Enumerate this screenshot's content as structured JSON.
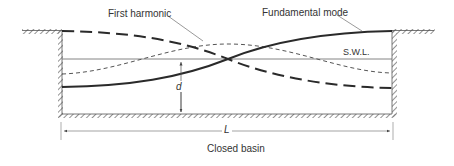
{
  "diagram": {
    "caption": "Closed basin",
    "labels": {
      "first_harmonic": "First harmonic",
      "fundamental_mode": "Fundamental mode",
      "swl": "S.W.L.",
      "depth": "d",
      "length": "L"
    },
    "colors": {
      "line": "#2a2a2a",
      "thin_line": "#555555",
      "hatch": "#777777",
      "text": "#333333"
    }
  }
}
